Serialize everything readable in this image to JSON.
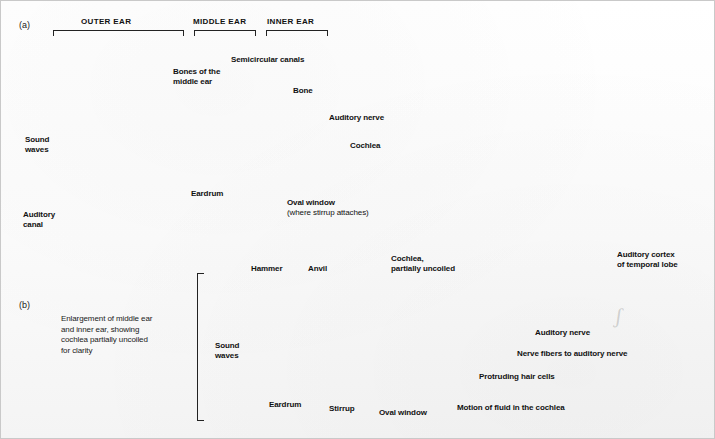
{
  "figure": {
    "background_color": "#fdfdfd",
    "ink_color": "#111111",
    "border_color": "#c9c9c9"
  },
  "panel_a": {
    "marker": "(a)",
    "section_headers": [
      {
        "text": "OUTER EAR"
      },
      {
        "text": "MIDDLE EAR"
      },
      {
        "text": "INNER EAR"
      }
    ],
    "labels": [
      {
        "text": "Sound\nwaves"
      },
      {
        "text": "Auditory\ncanal"
      },
      {
        "text": "Eardrum"
      },
      {
        "text": "Bones of the\nmiddle ear"
      },
      {
        "text": "Semicircular canals"
      },
      {
        "text": "Bone"
      },
      {
        "text": "Auditory nerve"
      },
      {
        "text": "Cochlea"
      },
      {
        "text": "Oval window"
      },
      {
        "text": "(where stirrup attaches)"
      }
    ]
  },
  "panel_b": {
    "marker": "(b)",
    "caption": "Enlargement of middle ear\nand inner ear, showing\ncochlea partially uncoiled\nfor clarity",
    "labels": [
      {
        "text": "Hammer"
      },
      {
        "text": "Anvil"
      },
      {
        "text": "Cochlea,\npartially uncoiled"
      },
      {
        "text": "Sound\nwaves"
      },
      {
        "text": "Eardrum"
      },
      {
        "text": "Stirrup"
      },
      {
        "text": "Oval window"
      },
      {
        "text": "Auditory nerve"
      },
      {
        "text": "Nerve fibers to auditory nerve"
      },
      {
        "text": "Protruding hair cells"
      },
      {
        "text": "Motion of fluid in the cochlea"
      }
    ]
  },
  "brain": {
    "labels": [
      {
        "text": "Auditory cortex\nof temporal lobe"
      }
    ]
  }
}
